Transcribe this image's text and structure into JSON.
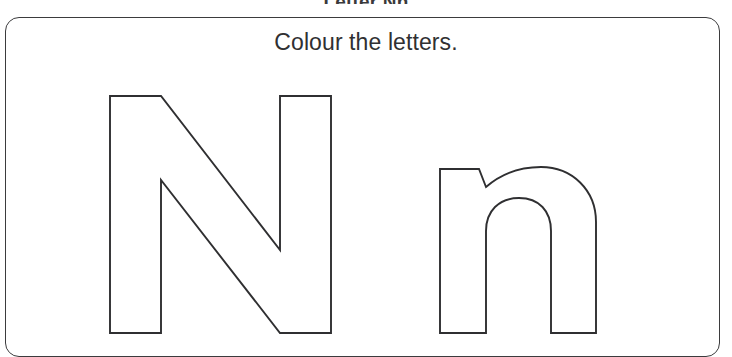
{
  "worksheet": {
    "title": "Letter Nn",
    "instruction": "Colour the letters.",
    "frame_color": "#3b3b3d",
    "outline_color": "#2f2f31",
    "background_color": "#ffffff",
    "text_color": "#303032"
  },
  "letters": [
    {
      "name": "uppercase-n",
      "character": "N",
      "case": "uppercase",
      "fill": "#ffffff",
      "stroke": "#2f2f31"
    },
    {
      "name": "lowercase-n",
      "character": "n",
      "case": "lowercase",
      "fill": "#ffffff",
      "stroke": "#2f2f31"
    }
  ]
}
